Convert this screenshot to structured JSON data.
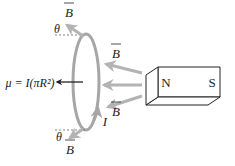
{
  "figure": {
    "rotation_deg": 180,
    "colors": {
      "loop": "#a6a6a6",
      "field_arrow": "#b3b3b3",
      "dipole_arrow": "#222222",
      "magnet_outline": "#222222",
      "dashed_line": "#666666"
    }
  },
  "magnet": {
    "north_label": "N",
    "south_label": "S"
  },
  "labels": {
    "B_field": "B",
    "theta": "θ",
    "current": "I",
    "dipole_moment": "μ = I(πR²)"
  }
}
